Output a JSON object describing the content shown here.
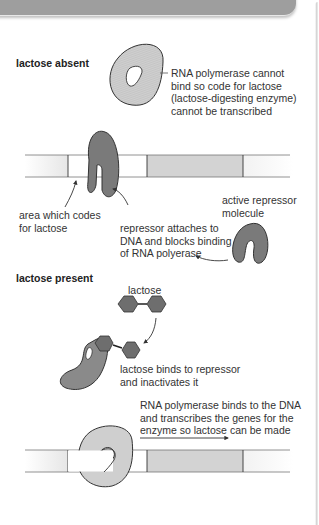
{
  "header": {
    "color": "#9e9e9e"
  },
  "sections": {
    "absent": {
      "heading": "lactose absent",
      "rna_polymerase_label": "RNA polymerase cannot\nbind so code for lactose\n(lactose-digesting enzyme)\ncannot be transcribed",
      "area_label": "area which codes\nfor lactose",
      "repressor_attach_label": "repressor attaches to\nDNA and blocks binding\nof RNA polyerase",
      "active_repressor_label": "active repressor\nmolecule"
    },
    "present": {
      "heading": "lactose present",
      "lactose_label": "lactose",
      "binds_label": "lactose binds to repressor\nand inactivates it",
      "rna_binds_label": "RNA polymerase binds to the DNA\nand transcribes the genes for the\nenzyme so lactose can be made"
    }
  },
  "colors": {
    "rna_polymerase": "#cfcfcf",
    "repressor": "#7a7a7a",
    "lactose": "#6e6e6e",
    "gene_region": "#d3d3d3",
    "dna_white": "#ffffff"
  }
}
